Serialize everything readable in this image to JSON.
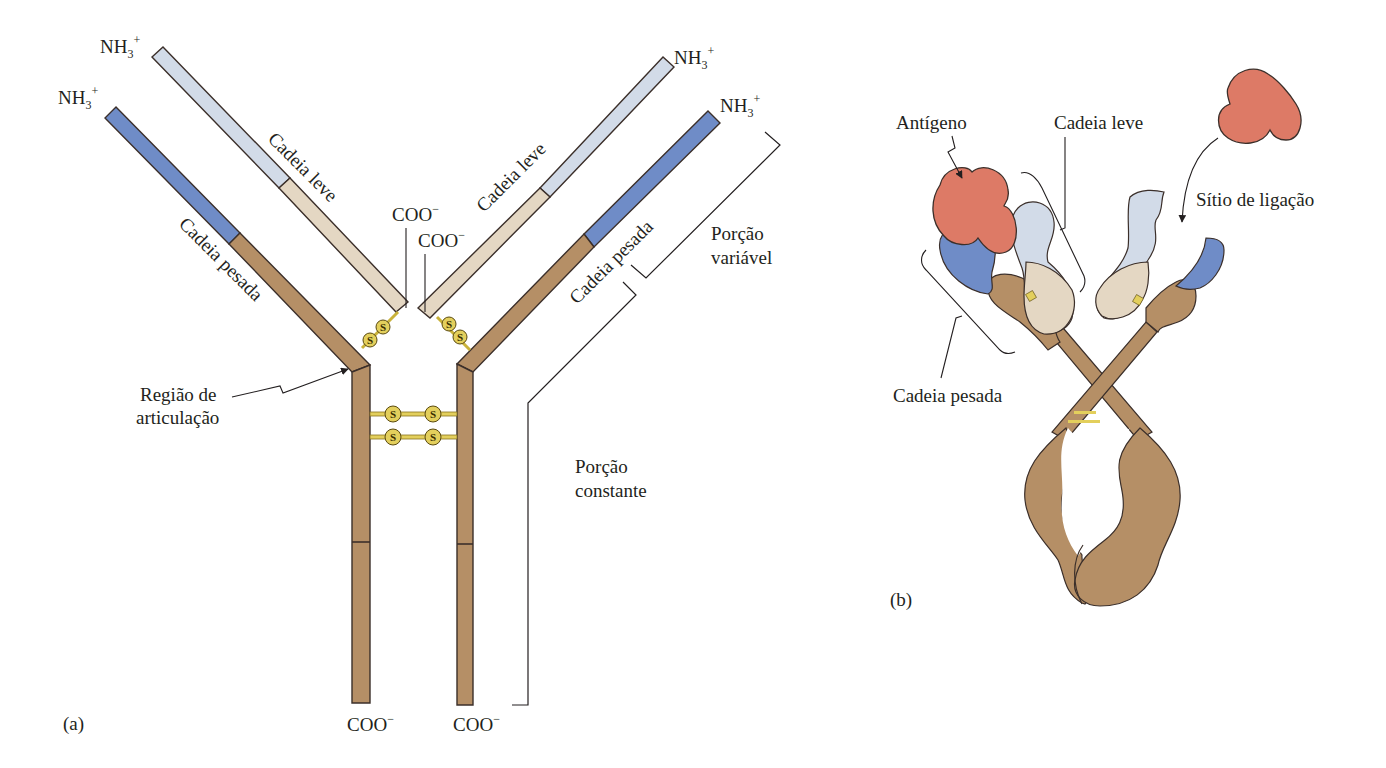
{
  "colors": {
    "heavy_constant": "#b58f66",
    "heavy_variable": "#6f8cc7",
    "light_constant": "#e4d7c3",
    "light_variable": "#d2dbe8",
    "antigen": "#dd7a66",
    "disulfide": "#e3cf5c",
    "outline": "#3b2f2a"
  },
  "panel_a": {
    "tag": "(a)",
    "n_terminus": "NH",
    "n_sub": "3",
    "n_sup": "+",
    "c_terminus": "COO",
    "c_sup": "−",
    "light_chain_left": "Cadeia leve",
    "light_chain_right": "Cadeia leve",
    "heavy_chain_left": "Cadeia pesada",
    "heavy_chain_right": "Cadeia pesada",
    "hinge_line1": "Região de",
    "hinge_line2": "articulação",
    "variable_line1": "Porção",
    "variable_line2": "variável",
    "constant_line1": "Porção",
    "constant_line2": "constante",
    "disulfide_symbol": "S"
  },
  "panel_b": {
    "tag": "(b)",
    "antigen": "Antígeno",
    "light_chain": "Cadeia leve",
    "heavy_chain": "Cadeia pesada",
    "binding_site": "Sítio de ligação"
  }
}
